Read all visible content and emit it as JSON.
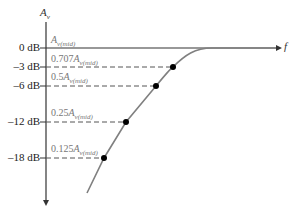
{
  "diagram": {
    "y_axis_label": "A",
    "y_axis_sub": "v",
    "x_axis_label": "f",
    "levels": [
      {
        "db_label": "0 dB",
        "gain_coef": "",
        "gain_symbol": "A",
        "gain_sub": "v(mid)",
        "y": 48,
        "dot_x": null
      },
      {
        "db_label": "–3 dB",
        "gain_coef": "0.707",
        "gain_symbol": "A",
        "gain_sub": "v(mid)",
        "y": 67,
        "dot_x": 173
      },
      {
        "db_label": "–6 dB",
        "gain_coef": "0.5",
        "gain_symbol": "A",
        "gain_sub": "v(mid)",
        "y": 86,
        "dot_x": 156
      },
      {
        "db_label": "–12 dB",
        "gain_coef": "0.25",
        "gain_symbol": "A",
        "gain_sub": "v(mid)",
        "y": 122,
        "dot_x": 126
      },
      {
        "db_label": "–18 dB",
        "gain_coef": "0.125",
        "gain_symbol": "A",
        "gain_sub": "v(mid)",
        "y": 158,
        "dot_x": 104
      }
    ],
    "colors": {
      "axis": "#333333",
      "curve": "#808080",
      "dashed": "#555555",
      "dot": "#000000",
      "gain_text": "#777777"
    }
  }
}
